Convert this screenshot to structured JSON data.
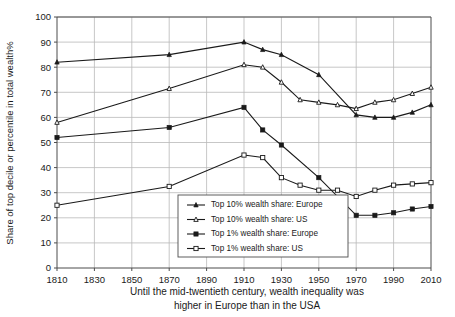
{
  "chart_data": {
    "type": "line",
    "title": "",
    "xlabel": "Until the mid-twentieth century, wealth inequality was higher in Europe than in the USA",
    "ylabel": "Share of top decile or percentile in total wealth%",
    "xlim": [
      1810,
      2010
    ],
    "ylim": [
      0,
      100
    ],
    "grid": true,
    "legend_position": "inside-bottom-center",
    "x_ticks": [
      "1810",
      "1830",
      "1850",
      "1870",
      "1890",
      "1910",
      "1930",
      "1950",
      "1970",
      "1990",
      "2010"
    ],
    "y_ticks": [
      "0",
      "10",
      "20",
      "30",
      "40",
      "50",
      "60",
      "70",
      "80",
      "90",
      "100"
    ],
    "caption_line1": "Until the mid-twentieth century, wealth inequality was",
    "caption_line2": "higher in Europe than in the USA",
    "series": [
      {
        "name": "Top 10% wealth share: Europe",
        "marker": "filled-triangle",
        "x": [
          1810,
          1870,
          1910,
          1920,
          1930,
          1950,
          1970,
          1980,
          1990,
          2000,
          2010
        ],
        "values": [
          82,
          85,
          90,
          87,
          85,
          77,
          61,
          60,
          60,
          62,
          65
        ]
      },
      {
        "name": "Top 10% wealth share: US",
        "marker": "open-triangle",
        "x": [
          1810,
          1870,
          1910,
          1920,
          1930,
          1940,
          1950,
          1960,
          1970,
          1980,
          1990,
          2000,
          2010
        ],
        "values": [
          58,
          71.5,
          81,
          80,
          74,
          67,
          66,
          65,
          63.5,
          66,
          67,
          69.5,
          72
        ]
      },
      {
        "name": "Top 1% wealth share: Europe",
        "marker": "filled-square",
        "x": [
          1810,
          1870,
          1910,
          1920,
          1930,
          1950,
          1970,
          1980,
          1990,
          2000,
          2010
        ],
        "values": [
          52,
          56,
          64,
          55,
          49,
          36,
          21,
          21,
          22,
          23.5,
          24.5
        ]
      },
      {
        "name": "Top 1% wealth share: US",
        "marker": "open-square",
        "x": [
          1810,
          1870,
          1910,
          1920,
          1930,
          1940,
          1950,
          1960,
          1970,
          1980,
          1990,
          2000,
          2010
        ],
        "values": [
          25,
          32.5,
          45,
          44,
          36,
          33,
          31,
          31,
          28.5,
          31,
          33,
          33.5,
          34
        ]
      }
    ]
  },
  "legend": {
    "items": [
      {
        "label": "Top 10% wealth share: Europe",
        "marker": "filled-triangle"
      },
      {
        "label": "Top 10% wealth share: US",
        "marker": "open-triangle"
      },
      {
        "label": "Top 1% wealth share: Europe",
        "marker": "filled-square"
      },
      {
        "label": "Top 1% wealth share: US",
        "marker": "open-square"
      }
    ]
  },
  "colors": {
    "ink": "#1a1a1a",
    "axis": "#4d4d4d",
    "grid": "#b9b9b9",
    "background": "#ffffff"
  }
}
